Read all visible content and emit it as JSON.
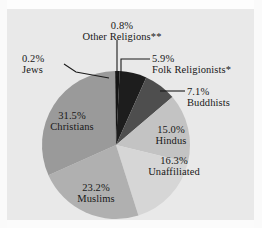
{
  "chart_data": {
    "type": "pie",
    "title": "",
    "subtitle": "",
    "xlabel": "",
    "ylabel": "",
    "legend_position": "none",
    "grid": false,
    "label_format": "percent-then-name",
    "start_angle_deg": 0,
    "direction": "clockwise",
    "categories": [
      "Other Religions**",
      "Folk Religionists*",
      "Buddhists",
      "Hindus",
      "Unaffiliated",
      "Muslims",
      "Christians",
      "Jews"
    ],
    "values": [
      0.8,
      5.9,
      7.1,
      15.0,
      16.3,
      23.2,
      31.5,
      0.2
    ],
    "slices": [
      {
        "name": "Other Religions**",
        "percent_label": "0.8%",
        "value": 0.8,
        "color": "#141414",
        "label_placement": "outside",
        "leader_line": true
      },
      {
        "name": "Folk Religionists*",
        "percent_label": "5.9%",
        "value": 5.9,
        "color": "#1d1d1d",
        "label_placement": "outside",
        "leader_line": true
      },
      {
        "name": "Buddhists",
        "percent_label": "7.1%",
        "value": 7.1,
        "color": "#4e4e4e",
        "label_placement": "outside",
        "leader_line": true
      },
      {
        "name": "Hindus",
        "percent_label": "15.0%",
        "value": 15.0,
        "color": "#c3c3c3",
        "label_placement": "inside",
        "leader_line": false
      },
      {
        "name": "Unaffiliated",
        "percent_label": "16.3%",
        "value": 16.3,
        "color": "#d6d6d6",
        "label_placement": "inside",
        "leader_line": false
      },
      {
        "name": "Muslims",
        "percent_label": "23.2%",
        "value": 23.2,
        "color": "#b0b0b0",
        "label_placement": "inside",
        "leader_line": false
      },
      {
        "name": "Christians",
        "percent_label": "31.5%",
        "value": 31.5,
        "color": "#9a9a9a",
        "label_placement": "inside",
        "leader_line": false
      },
      {
        "name": "Jews",
        "percent_label": "0.2%",
        "value": 0.2,
        "color": "#262626",
        "label_placement": "outside",
        "leader_line": true
      }
    ],
    "background_color": "#e9e9e9",
    "text_color": "#181818"
  },
  "labels": {
    "other_religions": {
      "percent": "0.8%",
      "name": "Other Religions**"
    },
    "jews": {
      "percent": "0.2%",
      "name": "Jews"
    },
    "folk_religionists": {
      "percent": "5.9%",
      "name": "Folk Religionists*"
    },
    "buddhists": {
      "percent": "7.1%",
      "name": "Buddhists"
    },
    "hindus": {
      "percent": "15.0%",
      "name": "Hindus"
    },
    "unaffiliated": {
      "percent": "16.3%",
      "name": "Unaffiliated"
    },
    "muslims": {
      "percent": "23.2%",
      "name": "Muslims"
    },
    "christians": {
      "percent": "31.5%",
      "name": "Christians"
    }
  }
}
